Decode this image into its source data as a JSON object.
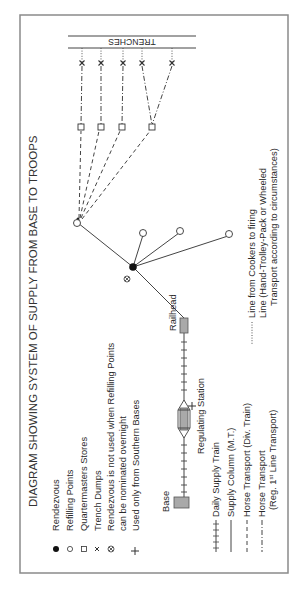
{
  "title": "DIAGRAM SHOWING SYSTEM OF SUPPLY FROM BASE TO TROOPS",
  "legend_symbols": [
    {
      "symbol": "filled-circle",
      "label": "Rendezvous"
    },
    {
      "symbol": "open-circle",
      "label": "Refilling Points"
    },
    {
      "symbol": "open-square",
      "label": "Quartermasters Stores"
    },
    {
      "symbol": "x-mark",
      "label": "Trench Dumps"
    },
    {
      "symbol": "circled-x",
      "label": "Rendezvous is not used when Refilling Points",
      "label2": "can be nominated overnight"
    },
    {
      "symbol": "plus",
      "label": "Used only from Southern Bases"
    }
  ],
  "legend_lines": [
    {
      "style": "tick-line",
      "label": "Daily Supply Train"
    },
    {
      "style": "solid",
      "label": "Supply Column (M.T.)"
    },
    {
      "style": "dashed",
      "label": "Horse Transport (Div. Train)"
    },
    {
      "style": "dash-dot",
      "label": "Horse Transport",
      "label2_prefix": "(Reg. 1",
      "label2_sup": "st",
      "label2_suffix": " Line Transport)"
    },
    {
      "style": "dotted",
      "label": "Line from Cookers to firing",
      "label2": "Line (Hand-Trolley-Pack or Wheeled",
      "label3": "Transport according to circumstances)"
    }
  ],
  "places": {
    "base": "Base",
    "railhead": "Railhead",
    "regulating_station": "Regulating Station",
    "trenches": "TRENCHES"
  }
}
